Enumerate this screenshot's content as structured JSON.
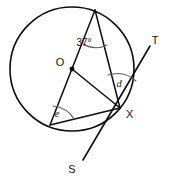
{
  "figure": {
    "background_color": "#ffffff",
    "stroke_color": "#0d0d0d",
    "arc_color": "#5d5d5d",
    "labels": {
      "center": "O",
      "tangent_point": "X",
      "tangent_end_top": "T",
      "tangent_end_bottom": "S",
      "angle_apex": "37°",
      "angle_d": "d",
      "angle_e": "e"
    },
    "label_positions": {
      "center": {
        "x": 60,
        "y": 66
      },
      "tangent_point": {
        "x": 126,
        "y": 118
      },
      "tangent_end_top": {
        "x": 155,
        "y": 44
      },
      "tangent_end_bottom": {
        "x": 72,
        "y": 173
      },
      "angle_apex": {
        "x": 84,
        "y": 46
      },
      "angle_d": {
        "x": 119,
        "y": 87
      },
      "angle_e": {
        "x": 57,
        "y": 117
      }
    },
    "circle": {
      "cx": 72,
      "cy": 69,
      "r": 62
    },
    "points": {
      "A_apex": {
        "x": 95,
        "y": 10
      },
      "O_center": {
        "x": 72,
        "y": 69
      },
      "B_lower_left": {
        "x": 50,
        "y": 125
      },
      "X_tangent_point": {
        "x": 120,
        "y": 108
      },
      "T_tangent_top": {
        "x": 150,
        "y": 46
      },
      "S_tangent_bottom": {
        "x": 83,
        "y": 160
      }
    },
    "segments": [
      {
        "name": "diameter-apex-to-lower-left",
        "from": "A_apex",
        "to": "B_lower_left"
      },
      {
        "name": "chord-apex-to-x",
        "from": "A_apex",
        "to": "X_tangent_point"
      },
      {
        "name": "radius-o-to-x",
        "from": "O_center",
        "to": "X_tangent_point"
      },
      {
        "name": "chord-lower-left-to-x",
        "from": "B_lower_left",
        "to": "X_tangent_point"
      },
      {
        "name": "tangent-line-s-to-t",
        "from": "S_tangent_bottom",
        "to": "T_tangent_top"
      }
    ],
    "angle_arcs": [
      {
        "name": "arc-37-degrees",
        "vertex": "A_apex"
      },
      {
        "name": "arc-d",
        "vertex": "X_tangent_point"
      },
      {
        "name": "arc-e",
        "vertex": "B_lower_left"
      }
    ]
  }
}
